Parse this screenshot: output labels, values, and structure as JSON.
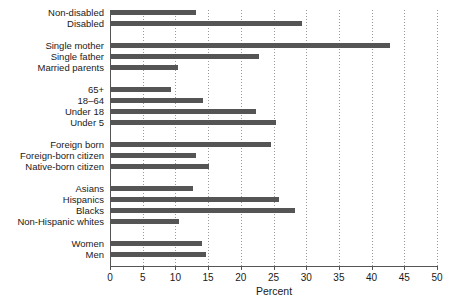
{
  "chart_data": {
    "type": "bar",
    "orientation": "horizontal",
    "title": "",
    "xlabel": "Percent",
    "ylabel": "",
    "xlim": [
      0,
      50
    ],
    "ylim": null,
    "grid": true,
    "grid_axis": "x",
    "legend": null,
    "xticks": [
      "0",
      "5",
      "10",
      "15",
      "20",
      "25",
      "30",
      "35",
      "40",
      "45",
      "50"
    ],
    "xtick_values": [
      0,
      5,
      10,
      15,
      20,
      25,
      30,
      35,
      40,
      45,
      50
    ],
    "bar_color": "#555555",
    "groups": [
      {
        "name": "disability",
        "categories": [
          "Non-disabled",
          "Disabled"
        ],
        "values": [
          13.1,
          29.4
        ]
      },
      {
        "name": "family-structure",
        "categories": [
          "Single mother",
          "Single father",
          "Married parents"
        ],
        "values": [
          42.8,
          22.8,
          10.4
        ]
      },
      {
        "name": "age",
        "categories": [
          "65+",
          "18–64",
          "Under 18",
          "Under 5"
        ],
        "values": [
          9.3,
          14.2,
          22.3,
          25.4
        ]
      },
      {
        "name": "nativity",
        "categories": [
          "Foreign born",
          "Foreign-born citizen",
          "Native-born citizen"
        ],
        "values": [
          24.6,
          13.1,
          15.1
        ]
      },
      {
        "name": "race-ethnicity",
        "categories": [
          "Asians",
          "Hispanics",
          "Blacks",
          "Non-Hispanic whites"
        ],
        "values": [
          12.7,
          25.8,
          28.3,
          10.5
        ]
      },
      {
        "name": "sex",
        "categories": [
          "Women",
          "Men"
        ],
        "values": [
          14.1,
          14.7
        ]
      }
    ],
    "categories": [
      "Non-disabled",
      "Disabled",
      "Single mother",
      "Single father",
      "Married parents",
      "65+",
      "18–64",
      "Under 18",
      "Under 5",
      "Foreign born",
      "Foreign-born citizen",
      "Native-born citizen",
      "Asians",
      "Hispanics",
      "Blacks",
      "Non-Hispanic whites",
      "Women",
      "Men"
    ],
    "values": [
      13.1,
      29.4,
      42.8,
      22.8,
      10.4,
      9.3,
      14.2,
      22.3,
      25.4,
      24.6,
      13.1,
      15.1,
      12.7,
      25.8,
      28.3,
      10.5,
      14.1,
      14.7
    ]
  }
}
